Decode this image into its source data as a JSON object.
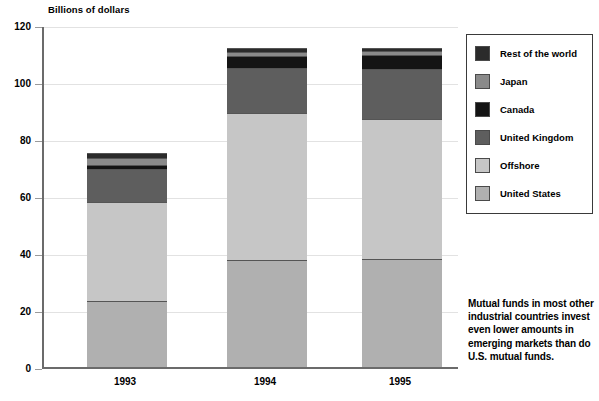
{
  "axis_title": "Billions of dollars",
  "legend": {
    "items": [
      {
        "label": "Rest of the world",
        "color": "#2b2b2b",
        "key": "rest_of_world"
      },
      {
        "label": "Japan",
        "color": "#8a8a8a",
        "key": "japan"
      },
      {
        "label": "Canada",
        "color": "#141414",
        "key": "canada"
      },
      {
        "label": "United Kingdom",
        "color": "#5e5e5e",
        "key": "united_kingdom"
      },
      {
        "label": "Offshore",
        "color": "#c6c6c6",
        "key": "offshore"
      },
      {
        "label": "United States",
        "color": "#b0b0b0",
        "key": "united_states"
      }
    ]
  },
  "annotation": "Mutual funds in most other industrial countries invest even lower amounts in emerging markets than do U.S. mutual funds.",
  "yticks": [
    "0",
    "20",
    "40",
    "60",
    "80",
    "100",
    "120"
  ],
  "xticks": [
    "1993",
    "1994",
    "1995"
  ],
  "chart_data": {
    "type": "bar",
    "subtype": "stacked-vertical",
    "title": "",
    "xlabel": "",
    "ylabel": "Billions of dollars",
    "ylim": [
      0,
      120
    ],
    "ytick_step": 20,
    "grid": true,
    "legend_position": "right",
    "categories": [
      "1993",
      "1994",
      "1995"
    ],
    "series": [
      {
        "name": "United States",
        "color": "#b0b0b0",
        "values": [
          23,
          37.5,
          38
        ]
      },
      {
        "name": "Offshore",
        "color": "#c6c6c6",
        "values": [
          35,
          51.5,
          49
        ]
      },
      {
        "name": "United Kingdom",
        "color": "#5e5e5e",
        "values": [
          11.5,
          16,
          17.5
        ]
      },
      {
        "name": "Canada",
        "color": "#141414",
        "values": [
          1.5,
          4,
          5
        ]
      },
      {
        "name": "Japan",
        "color": "#8a8a8a",
        "values": [
          2.5,
          1.5,
          1.5
        ]
      },
      {
        "name": "Rest of the world",
        "color": "#2b2b2b",
        "values": [
          1.5,
          1.5,
          1
        ]
      }
    ],
    "totals": [
      75,
      112,
      112
    ]
  }
}
